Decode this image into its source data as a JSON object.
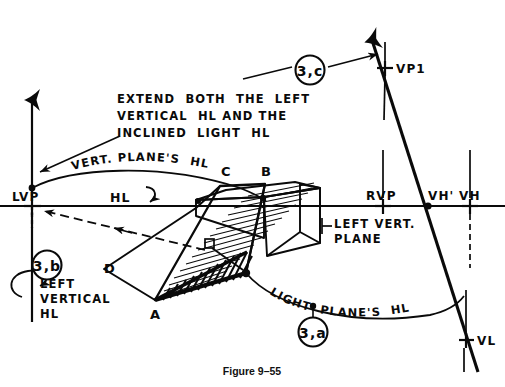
{
  "figure": {
    "caption": "Figure 9–55",
    "background": "#ffffff",
    "ink": "#0a0a0a"
  },
  "annotations": {
    "instruction_line1": "EXTEND  BOTH  THE  LEFT",
    "instruction_line2": "VERTICAL  HL AND THE",
    "instruction_line3": "INCLINED  LIGHT  HL",
    "vert_planes_hl": "VERT. PLANE'S  HL",
    "light_planes_hl": "LIGHT  PLANE'S  HL",
    "left_vertical_hl_1": "LEFT",
    "left_vertical_hl_2": "VERTICAL",
    "left_vertical_hl_3": "HL",
    "left_vert_plane_1": "LEFT VERT.",
    "left_vert_plane_2": "PLANE",
    "hl": "HL"
  },
  "callouts": [
    {
      "id": "callout-3c",
      "label": "3,c",
      "cx": 310,
      "cy": 70
    },
    {
      "id": "callout-3b",
      "label": "3,b",
      "cx": 47,
      "cy": 265
    },
    {
      "id": "callout-3a",
      "label": "3,a",
      "cx": 313,
      "cy": 330
    }
  ],
  "points": [
    {
      "name": "LVP",
      "label": "LVP",
      "x": 32,
      "y": 206,
      "mark": "plus"
    },
    {
      "name": "VP1",
      "label": "VP1",
      "x": 385,
      "y": 68,
      "mark": "plus"
    },
    {
      "name": "RVP",
      "label": "RVP",
      "x": 383,
      "y": 206,
      "mark": "plus"
    },
    {
      "name": "VHp",
      "label": "VH'",
      "x": 428,
      "y": 206,
      "mark": "dot"
    },
    {
      "name": "VH",
      "label": "VH",
      "x": 470,
      "y": 206,
      "mark": "plus"
    },
    {
      "name": "VL",
      "label": "VL",
      "x": 467,
      "y": 340,
      "mark": "plus"
    }
  ],
  "vertices": [
    {
      "label": "A",
      "x": 155,
      "y": 305
    },
    {
      "label": "B",
      "x": 265,
      "y": 174
    },
    {
      "label": "C",
      "x": 226,
      "y": 174
    },
    {
      "label": "D",
      "x": 112,
      "y": 268
    }
  ],
  "colors": {
    "ink": "#0a0a0a",
    "paper": "#ffffff"
  }
}
